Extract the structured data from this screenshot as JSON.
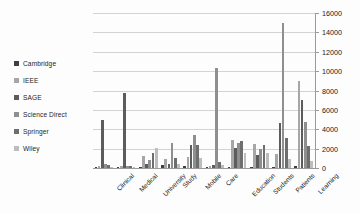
{
  "chart_data": {
    "type": "bar",
    "title": "",
    "xlabel": "",
    "ylabel": "",
    "ylim": [
      0,
      16000
    ],
    "ytick_step": 2000,
    "yticks": [
      "0",
      "2000",
      "4000",
      "6000",
      "8000",
      "10000",
      "12000",
      "14000",
      "16000"
    ],
    "grid": true,
    "legend_position": "left",
    "axis_side": "right",
    "categories": [
      "Clinical",
      "Medical",
      "University",
      "Study",
      "Mobile",
      "Care",
      "Education",
      "Students",
      "Patients",
      "Learning"
    ],
    "series": [
      {
        "name": "Cambridge",
        "color": "#3f3f3f",
        "values": [
          120,
          90,
          150,
          260,
          180,
          130,
          110,
          95,
          140,
          160
        ]
      },
      {
        "name": "IEEE",
        "color": "#a6a6a6",
        "values": [
          200,
          160,
          1200,
          900,
          1150,
          250,
          2900,
          2500,
          1450,
          9000
        ]
      },
      {
        "name": "SAGE",
        "color": "#5c5c5c",
        "values": [
          5000,
          7700,
          420,
          380,
          2400,
          330,
          2100,
          1300,
          4600,
          7000
        ]
      },
      {
        "name": "Science Direct",
        "color": "#8f8f8f",
        "values": [
          380,
          250,
          800,
          2600,
          3400,
          10300,
          2600,
          2000,
          15000,
          4700
        ]
      },
      {
        "name": "Springer",
        "color": "#6e6e6e",
        "values": [
          300,
          210,
          1600,
          1050,
          2350,
          600,
          2750,
          2350,
          3100,
          2300
        ]
      },
      {
        "name": "Wiley",
        "color": "#bdbdbd",
        "values": [
          150,
          130,
          2050,
          450,
          1000,
          350,
          1500,
          1600,
          900,
          700
        ]
      }
    ]
  },
  "legend": {
    "items": [
      {
        "label": "Cambridge",
        "color": "#3f3f3f"
      },
      {
        "label": "IEEE",
        "color": "#a6a6a6"
      },
      {
        "label": "SAGE",
        "color": "#5c5c5c"
      },
      {
        "label": "Science Direct",
        "color": "#8f8f8f"
      },
      {
        "label": "Springer",
        "color": "#6e6e6e"
      },
      {
        "label": "Wiley",
        "color": "#bdbdbd"
      }
    ]
  },
  "colors": {
    "gridline": "#d3d3d3",
    "axis": "#9a9a9a",
    "text": "#1a1a1a",
    "background": "#fdfdfd"
  }
}
